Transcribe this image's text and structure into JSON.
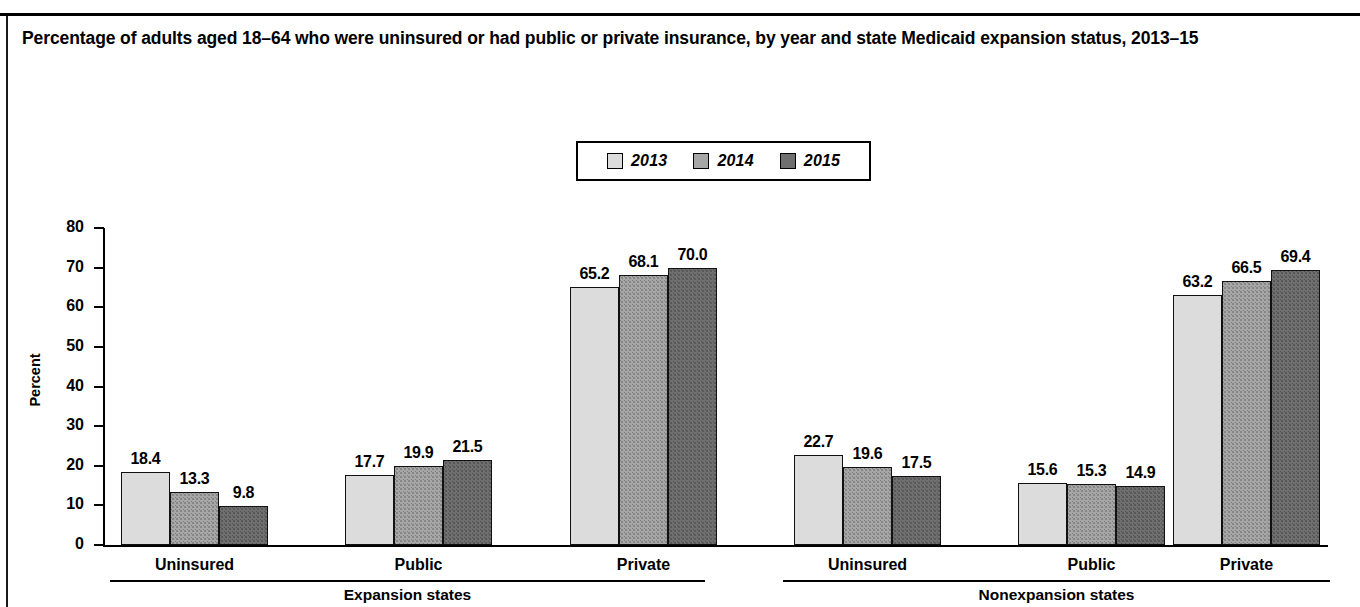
{
  "title": "Percentage of adults aged 18–64 who were uninsured or had public or private insurance, by year and state Medicaid expansion status, 2013–15",
  "legend": {
    "items": [
      {
        "label": "2013",
        "color": "#dcdcdc"
      },
      {
        "label": "2014",
        "color": "#a6a6a6"
      },
      {
        "label": "2015",
        "color": "#6f6f6f"
      }
    ]
  },
  "axis": {
    "ylabel": "Percent",
    "yticks": [
      "0",
      "10",
      "20",
      "30",
      "40",
      "50",
      "60",
      "70",
      "80"
    ]
  },
  "groups": [
    {
      "label": "Expansion states",
      "categories": [
        "Uninsured",
        "Public",
        "Private"
      ]
    },
    {
      "label": "Nonexpansion states",
      "categories": [
        "Uninsured",
        "Public",
        "Private"
      ]
    }
  ],
  "chart_data": {
    "type": "bar",
    "title": "Percentage of adults aged 18–64 who were uninsured or had public or private insurance, by year and state Medicaid expansion status, 2013–15",
    "xlabel": "",
    "ylabel": "Percent",
    "ylim": [
      0,
      80
    ],
    "ytick_step": 10,
    "grid": false,
    "legend_position": "top-center",
    "legend_entries": [
      "2013",
      "2014",
      "2015"
    ],
    "group_labels": [
      "Expansion states",
      "Nonexpansion states"
    ],
    "categories": [
      "Expansion states – Uninsured",
      "Expansion states – Public",
      "Expansion states – Private",
      "Nonexpansion states – Uninsured",
      "Nonexpansion states – Public",
      "Nonexpansion states – Private"
    ],
    "series": [
      {
        "name": "2013",
        "values": [
          18.4,
          17.7,
          65.2,
          22.7,
          15.6,
          63.2
        ]
      },
      {
        "name": "2014",
        "values": [
          13.3,
          19.9,
          68.1,
          19.6,
          15.3,
          66.5
        ]
      },
      {
        "name": "2015",
        "values": [
          9.8,
          21.5,
          70.0,
          17.5,
          14.9,
          69.4
        ]
      }
    ],
    "bars": [
      {
        "group": "Expansion states",
        "category": "Uninsured",
        "year": "2013",
        "value": 18.4,
        "label": "18.4"
      },
      {
        "group": "Expansion states",
        "category": "Uninsured",
        "year": "2014",
        "value": 13.3,
        "label": "13.3"
      },
      {
        "group": "Expansion states",
        "category": "Uninsured",
        "year": "2015",
        "value": 9.8,
        "label": "9.8"
      },
      {
        "group": "Expansion states",
        "category": "Public",
        "year": "2013",
        "value": 17.7,
        "label": "17.7"
      },
      {
        "group": "Expansion states",
        "category": "Public",
        "year": "2014",
        "value": 19.9,
        "label": "19.9"
      },
      {
        "group": "Expansion states",
        "category": "Public",
        "year": "2015",
        "value": 21.5,
        "label": "21.5"
      },
      {
        "group": "Expansion states",
        "category": "Private",
        "year": "2013",
        "value": 65.2,
        "label": "65.2"
      },
      {
        "group": "Expansion states",
        "category": "Private",
        "year": "2014",
        "value": 68.1,
        "label": "68.1"
      },
      {
        "group": "Expansion states",
        "category": "Private",
        "year": "2015",
        "value": 70.0,
        "label": "70.0"
      },
      {
        "group": "Nonexpansion states",
        "category": "Uninsured",
        "year": "2013",
        "value": 22.7,
        "label": "22.7"
      },
      {
        "group": "Nonexpansion states",
        "category": "Uninsured",
        "year": "2014",
        "value": 19.6,
        "label": "19.6"
      },
      {
        "group": "Nonexpansion states",
        "category": "Uninsured",
        "year": "2015",
        "value": 17.5,
        "label": "17.5"
      },
      {
        "group": "Nonexpansion states",
        "category": "Public",
        "year": "2013",
        "value": 15.6,
        "label": "15.6"
      },
      {
        "group": "Nonexpansion states",
        "category": "Public",
        "year": "2014",
        "value": 15.3,
        "label": "15.3"
      },
      {
        "group": "Nonexpansion states",
        "category": "Public",
        "year": "2015",
        "value": 14.9,
        "label": "14.9"
      },
      {
        "group": "Nonexpansion states",
        "category": "Private",
        "year": "2013",
        "value": 63.2,
        "label": "63.2"
      },
      {
        "group": "Nonexpansion states",
        "category": "Private",
        "year": "2014",
        "value": 66.5,
        "label": "66.5"
      },
      {
        "group": "Nonexpansion states",
        "category": "Private",
        "year": "2015",
        "value": 69.4,
        "label": "69.4"
      }
    ]
  }
}
